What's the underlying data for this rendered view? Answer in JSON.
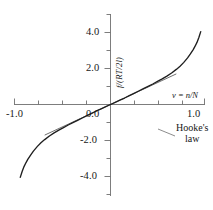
{
  "chart_data": {
    "type": "line",
    "title": "",
    "xlabel": "v = n/N",
    "ylabel": "f/(RT/2l)",
    "xlim": [
      -1.0,
      1.0
    ],
    "ylim": [
      -5.0,
      5.0
    ],
    "grid": false,
    "legend_position": "none",
    "xticks": [
      -1.0,
      0.0,
      1.0
    ],
    "xticklabels": [
      "-1.0",
      "0.0",
      "1.0"
    ],
    "yticks": [
      -4.0,
      -2.0,
      0.0,
      2.0,
      4.0
    ],
    "yticklabels": [
      "-4.0",
      "-2.0",
      "0.0",
      "2.0",
      "4.0"
    ],
    "x_minor_ticks": [
      -0.75,
      -0.5,
      -0.25,
      0.25,
      0.5,
      0.75
    ],
    "y_minor_ticks": [
      -5.0,
      -3.0,
      -1.0,
      1.0,
      3.0,
      5.0
    ],
    "annotations": [
      {
        "name": "hookes-law",
        "text_line1": "Hooke's",
        "text_line2": "law",
        "points_to_series": "hookes-law-tangent"
      }
    ],
    "series": [
      {
        "name": "inverse-langevin-curve",
        "label": "",
        "color": "#1f1f1f",
        "x": [
          -0.96,
          -0.94,
          -0.92,
          -0.9,
          -0.88,
          -0.85,
          -0.82,
          -0.78,
          -0.74,
          -0.7,
          -0.65,
          -0.6,
          -0.55,
          -0.5,
          -0.45,
          -0.4,
          -0.35,
          -0.3,
          -0.25,
          -0.2,
          -0.15,
          -0.1,
          -0.05,
          0.0,
          0.05,
          0.1,
          0.15,
          0.2,
          0.25,
          0.3,
          0.35,
          0.4,
          0.45,
          0.5,
          0.55,
          0.6,
          0.65,
          0.7,
          0.74,
          0.78,
          0.82,
          0.85,
          0.88,
          0.9,
          0.92,
          0.94,
          0.96
        ],
        "y": [
          -4.05,
          -3.72,
          -3.45,
          -3.24,
          -3.05,
          -2.81,
          -2.59,
          -2.34,
          -2.13,
          -1.95,
          -1.75,
          -1.58,
          -1.42,
          -1.28,
          -1.14,
          -1.01,
          -0.88,
          -0.75,
          -0.62,
          -0.49,
          -0.36,
          -0.24,
          -0.12,
          0.0,
          0.12,
          0.24,
          0.36,
          0.49,
          0.62,
          0.75,
          0.88,
          1.01,
          1.14,
          1.28,
          1.42,
          1.58,
          1.75,
          1.95,
          2.13,
          2.34,
          2.59,
          2.81,
          3.05,
          3.24,
          3.45,
          3.72,
          4.05
        ]
      },
      {
        "name": "hookes-law-tangent",
        "label": "Hooke's law",
        "color": "#4a4a4a",
        "slope": 2.42,
        "x": [
          -0.7,
          0.7
        ],
        "y": [
          -1.7,
          1.7
        ]
      }
    ]
  },
  "axes": {
    "x_label_text": "v = n/N",
    "y_label_text": "f/(RT/2l)",
    "x_tick_left": "-1.0",
    "x_tick_center": "0.0",
    "x_tick_right": "1.0",
    "y_tick_4": "4.0",
    "y_tick_2": "2.0",
    "y_tick_neg2": "-2.0",
    "y_tick_neg4": "-4.0"
  },
  "annotation": {
    "hookes_line1": "Hooke's",
    "hookes_line2": "law"
  },
  "colors": {
    "curve": "#1f1f1f",
    "tangent": "#4a4a4a",
    "axis": "#6e6e6e",
    "text": "#171717",
    "background": "#ffffff"
  }
}
